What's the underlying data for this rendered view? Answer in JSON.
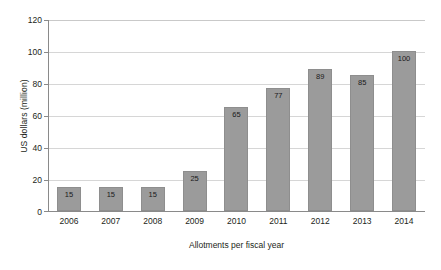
{
  "chart_data": {
    "type": "bar",
    "title": "",
    "xlabel": "Allotments per fiscal year",
    "ylabel": "US dollars (million)",
    "categories": [
      "2006",
      "2007",
      "2008",
      "2009",
      "2010",
      "2011",
      "2012",
      "2013",
      "2014"
    ],
    "values": [
      15,
      15,
      15,
      25,
      65,
      77,
      89,
      85,
      100
    ],
    "data_labels": [
      "15",
      "15",
      "15",
      "25",
      "65",
      "77",
      "89",
      "85",
      "100"
    ],
    "ylim": [
      0,
      120
    ],
    "yticks": [
      0,
      20,
      40,
      60,
      80,
      100,
      120
    ],
    "ytick_labels": [
      "0",
      "20",
      "40",
      "60",
      "80",
      "100",
      "120"
    ],
    "grid": true,
    "grid_axis": "y",
    "legend": null,
    "legend_position": "none",
    "bar_color": "#9b9b9b",
    "bar_edge_color": "#8e8e8e",
    "grid_color": "#d6d6d6",
    "axis_color": "#8a8a8a",
    "text_color": "#231f20",
    "background_color": "#ffffff"
  }
}
